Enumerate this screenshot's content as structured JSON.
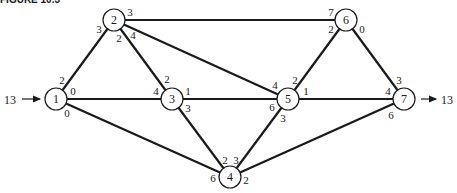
{
  "header": {
    "text": "FIGURE 10.3"
  },
  "diagram": {
    "nodes": [
      {
        "id": "1",
        "x": 56,
        "y": 99
      },
      {
        "id": "2",
        "x": 114,
        "y": 20
      },
      {
        "id": "3",
        "x": 172,
        "y": 99
      },
      {
        "id": "4",
        "x": 230,
        "y": 177
      },
      {
        "id": "5",
        "x": 288,
        "y": 99
      },
      {
        "id": "6",
        "x": 346,
        "y": 20
      },
      {
        "id": "7",
        "x": 404,
        "y": 99
      }
    ],
    "edges": [
      {
        "from": "1",
        "to": "2",
        "cap_from": "2",
        "cap_to": "3"
      },
      {
        "from": "1",
        "to": "3",
        "cap_from": "0",
        "cap_to": "4"
      },
      {
        "from": "1",
        "to": "4",
        "cap_from": "0",
        "cap_to": "6"
      },
      {
        "from": "2",
        "to": "3",
        "cap_from": "2",
        "cap_to": "2"
      },
      {
        "from": "2",
        "to": "5",
        "cap_from": "4",
        "cap_to": "4"
      },
      {
        "from": "2",
        "to": "6",
        "cap_from": "3",
        "cap_to": "7"
      },
      {
        "from": "3",
        "to": "5",
        "cap_from": "1",
        "cap_to": "6"
      },
      {
        "from": "3",
        "to": "4",
        "cap_from": "3",
        "cap_to": "2"
      },
      {
        "from": "5",
        "to": "4",
        "cap_from": "3",
        "cap_to": "3"
      },
      {
        "from": "5",
        "to": "6",
        "cap_from": "2",
        "cap_to": "2"
      },
      {
        "from": "5",
        "to": "7",
        "cap_from": "1",
        "cap_to": "4"
      },
      {
        "from": "6",
        "to": "7",
        "cap_from": "0",
        "cap_to": "3"
      },
      {
        "from": "4",
        "to": "7",
        "cap_from": "2",
        "cap_to": "6"
      }
    ],
    "source": {
      "node": "1",
      "flow": "13"
    },
    "sink": {
      "node": "7",
      "flow": "13"
    }
  }
}
